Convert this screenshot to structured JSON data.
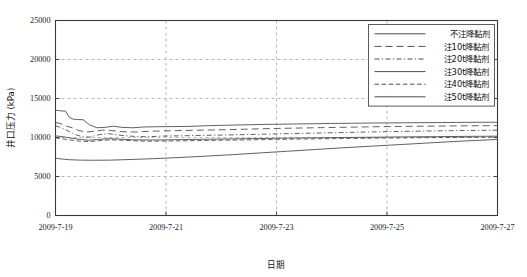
{
  "chart_data": {
    "type": "line",
    "title": "",
    "xlabel": "日期",
    "ylabel": "井口压力 (kPa)",
    "ylim": [
      0,
      25000
    ],
    "ytick_labels": [
      "0",
      "5000",
      "10000",
      "15000",
      "20000",
      "25000"
    ],
    "ytick_values": [
      0,
      5000,
      10000,
      15000,
      20000,
      25000
    ],
    "xtick_labels": [
      "2009-7-19",
      "2009-7-21",
      "2009-7-23",
      "2009-7-25",
      "2009-7-27"
    ],
    "xtick_values": [
      0,
      2,
      4,
      6,
      8
    ],
    "xlim": [
      0,
      8
    ],
    "grid": "dashed-gray",
    "legend_position": "top-right",
    "series": [
      {
        "name": "不注降黏剂",
        "style": "solid",
        "dash": "none",
        "color": "#454545",
        "x": [
          0.0,
          0.06,
          0.12,
          0.18,
          0.25,
          0.32,
          0.4,
          0.5,
          0.62,
          0.75,
          0.9,
          1.05,
          1.2,
          1.4,
          1.6,
          1.85,
          2.1,
          2.4,
          2.7,
          3.0,
          3.4,
          3.8,
          4.2,
          4.6,
          5.0,
          5.4,
          5.8,
          6.2,
          6.6,
          7.0,
          7.4,
          7.7,
          8.0
        ],
        "y": [
          13500,
          13450,
          13400,
          13380,
          12600,
          12350,
          12300,
          12280,
          11600,
          11250,
          11300,
          11450,
          11300,
          11250,
          11350,
          11380,
          11400,
          11420,
          11500,
          11560,
          11620,
          11680,
          11720,
          11760,
          11800,
          11830,
          11860,
          11880,
          11900,
          11920,
          11940,
          11950,
          11960
        ]
      },
      {
        "name": "注10t降黏剂",
        "style": "long-dash",
        "dash": "7 4",
        "color": "#454545",
        "x": [
          0.0,
          0.06,
          0.12,
          0.2,
          0.3,
          0.42,
          0.55,
          0.7,
          0.85,
          1.0,
          1.2,
          1.45,
          1.7,
          2.0,
          2.3,
          2.7,
          3.1,
          3.5,
          3.9,
          4.3,
          4.8,
          5.3,
          5.8,
          6.3,
          6.8,
          7.3,
          7.7,
          8.0
        ],
        "y": [
          11900,
          11850,
          11700,
          11450,
          11250,
          10900,
          10700,
          10800,
          10950,
          10900,
          10750,
          10700,
          10800,
          10850,
          10900,
          10950,
          11000,
          11080,
          11150,
          11200,
          11260,
          11320,
          11380,
          11420,
          11460,
          11490,
          11510,
          11520
        ]
      },
      {
        "name": "注20t降黏剂",
        "style": "dash-dot",
        "dash": "5 2.4 1.2 2.4",
        "color": "#454545",
        "x": [
          0.0,
          0.07,
          0.15,
          0.25,
          0.35,
          0.48,
          0.62,
          0.78,
          0.95,
          1.15,
          1.4,
          1.65,
          1.95,
          2.3,
          2.7,
          3.1,
          3.6,
          4.1,
          4.6,
          5.1,
          5.6,
          6.1,
          6.6,
          7.1,
          7.6,
          8.0
        ],
        "y": [
          11500,
          11350,
          11100,
          10750,
          10400,
          10100,
          10050,
          10350,
          10500,
          10300,
          10150,
          10100,
          10180,
          10220,
          10280,
          10320,
          10400,
          10480,
          10550,
          10620,
          10700,
          10760,
          10820,
          10870,
          10910,
          10940
        ]
      },
      {
        "name": "注30t降黏剂",
        "style": "solid",
        "dash": "none",
        "color": "#5a5a5a",
        "x": [
          0.0,
          0.08,
          0.18,
          0.3,
          0.45,
          0.6,
          0.78,
          0.95,
          1.15,
          1.4,
          1.7,
          2.0,
          2.35,
          2.75,
          3.2,
          3.7,
          4.2,
          4.7,
          5.2,
          5.8,
          6.3,
          6.9,
          7.4,
          8.0
        ],
        "y": [
          10200,
          10150,
          10050,
          9900,
          9750,
          9650,
          9750,
          9850,
          9800,
          9700,
          9680,
          9700,
          9740,
          9780,
          9820,
          9870,
          9920,
          9960,
          10000,
          10040,
          10080,
          10110,
          10140,
          10170
        ]
      },
      {
        "name": "注40t降黏剂",
        "style": "medium-dash",
        "dash": "4.5 2.6",
        "color": "#454545",
        "x": [
          0.0,
          0.08,
          0.18,
          0.3,
          0.45,
          0.62,
          0.8,
          1.0,
          1.22,
          1.5,
          1.8,
          2.15,
          2.55,
          3.0,
          3.5,
          4.0,
          4.5,
          5.1,
          5.7,
          6.3,
          6.9,
          7.5,
          8.0
        ],
        "y": [
          9950,
          9880,
          9780,
          9650,
          9520,
          9480,
          9600,
          9700,
          9650,
          9550,
          9530,
          9560,
          9600,
          9650,
          9700,
          9760,
          9810,
          9860,
          9910,
          9950,
          9990,
          10020,
          10050
        ]
      },
      {
        "name": "注50t降黏剂",
        "style": "solid",
        "dash": "none",
        "color": "#6a6a6a",
        "x": [
          0.0,
          0.1,
          0.25,
          0.45,
          0.7,
          1.0,
          1.35,
          1.75,
          2.2,
          2.7,
          3.2,
          3.7,
          4.2,
          4.7,
          5.2,
          5.7,
          6.2,
          6.7,
          7.2,
          7.6,
          8.0
        ],
        "y": [
          7350,
          7250,
          7150,
          7100,
          7080,
          7100,
          7180,
          7280,
          7420,
          7600,
          7800,
          8020,
          8240,
          8460,
          8680,
          8880,
          9080,
          9280,
          9480,
          9620,
          9750
        ]
      }
    ]
  },
  "legend": {
    "items": [
      {
        "label": "不注降黏剂"
      },
      {
        "label": "注10t降黏剂"
      },
      {
        "label": "注20t降黏剂"
      },
      {
        "label": "注30t降黏剂"
      },
      {
        "label": "注40t降黏剂"
      },
      {
        "label": "注50t降黏剂"
      }
    ]
  }
}
